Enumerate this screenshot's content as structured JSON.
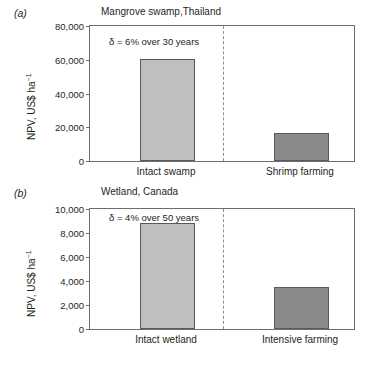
{
  "figure": {
    "background": "#ffffff",
    "colors": {
      "axis": "#6d6e71",
      "text": "#231f20",
      "bar_light": "#bfbfbf",
      "bar_dark": "#8a8a8a",
      "bar_outline": "#58595b",
      "divider": "#8d8e90"
    }
  },
  "panels": [
    {
      "letter": "(a)",
      "title": "Mangrove swamp,Thailand",
      "annotation": "δ = 6% over 30 years",
      "ylabel_main": "NPV, US$ ha",
      "ylabel_sup": "−1",
      "ticks": [
        "80,000",
        "60,000",
        "40,000",
        "20,000",
        "0"
      ],
      "categories": [
        "Intact swamp",
        "Shrimp farming"
      ],
      "values": [
        59800,
        16200
      ]
    },
    {
      "letter": "(b)",
      "title": "Wetland, Canada",
      "annotation": "δ = 4% over 50 years",
      "ylabel_main": "NPV, US$ ha",
      "ylabel_sup": "−1",
      "ticks": [
        "10,000",
        "8,000",
        "6,000",
        "4,000",
        "2,000",
        "0"
      ],
      "categories": [
        "Intact wetland",
        "Intensive farming"
      ],
      "values": [
        8700,
        3450
      ]
    }
  ],
  "chart_data": [
    {
      "type": "bar",
      "title": "Mangrove swamp,Thailand",
      "panel": "(a)",
      "categories": [
        "Intact swamp",
        "Shrimp farming"
      ],
      "values": [
        59800,
        16200
      ],
      "xlabel": "",
      "ylabel": "NPV, US$ ha-1",
      "ylim": [
        0,
        80000
      ],
      "yticks": [
        0,
        20000,
        40000,
        60000,
        80000
      ],
      "ytick_labels": [
        "0",
        "20,000",
        "40,000",
        "60,000",
        "80,000"
      ],
      "annotations": [
        "δ = 6% over 30 years"
      ],
      "grid": false,
      "legend": "none",
      "bar_colors": [
        "#bfbfbf",
        "#8a8a8a"
      ],
      "divider": "dashed vertical line between categories"
    },
    {
      "type": "bar",
      "title": "Wetland, Canada",
      "panel": "(b)",
      "categories": [
        "Intact wetland",
        "Intensive farming"
      ],
      "values": [
        8700,
        3450
      ],
      "xlabel": "",
      "ylabel": "NPV, US$ ha-1",
      "ylim": [
        0,
        10000
      ],
      "yticks": [
        0,
        2000,
        4000,
        6000,
        8000,
        10000
      ],
      "ytick_labels": [
        "0",
        "2,000",
        "4,000",
        "6,000",
        "8,000",
        "10,000"
      ],
      "annotations": [
        "δ = 4% over 50 years"
      ],
      "grid": false,
      "legend": "none",
      "bar_colors": [
        "#bfbfbf",
        "#8a8a8a"
      ],
      "divider": "dashed vertical line between categories"
    }
  ]
}
